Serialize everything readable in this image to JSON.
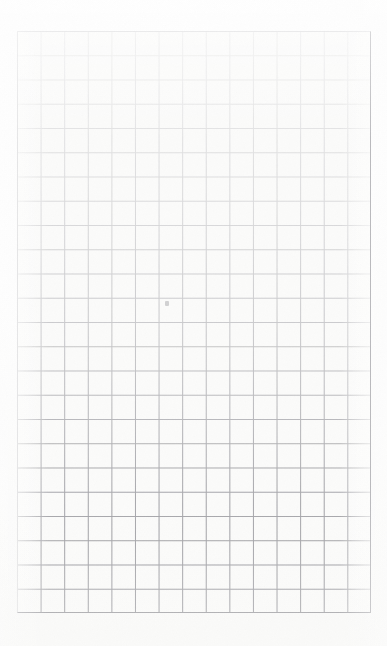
{
  "document": {
    "kind": "scanned-grid-paper",
    "title": "Blank graph paper sheet",
    "content_text": "",
    "visible_text": "",
    "notes": "No printed or handwritten text is present on the sheet."
  },
  "canvas": {
    "width": 387,
    "height": 646,
    "background_color": "#ffffff",
    "paper_color": "#fdfdfc"
  },
  "grid": {
    "left": 17,
    "top": 31,
    "width": 354,
    "height": 582,
    "columns": 15,
    "rows": 24,
    "cell_width": 23.6,
    "cell_height": 24.25,
    "line_color_faint": "#dcdcde",
    "line_color_dark": "#9a9a9f",
    "line_width": 1,
    "cell_fill_color": "#fbfbfa",
    "border_color": "#c9c9cc"
  },
  "scan": {
    "gradient_description": "ruling is very pale at the top of the sheet and progressively darker toward the bottom",
    "top_line_opacity": 0.18,
    "bottom_line_opacity": 1.0,
    "margin_color": "#ffffff"
  },
  "artifacts": [
    {
      "name": "smudge",
      "x": 165,
      "y": 301,
      "width": 4,
      "height": 5,
      "color": "#96969b"
    }
  ]
}
